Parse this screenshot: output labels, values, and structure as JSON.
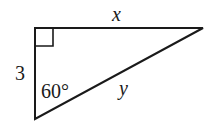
{
  "diagram": {
    "type": "right-triangle",
    "vertices": {
      "right_angle": [
        35,
        28
      ],
      "top_right": [
        203,
        28
      ],
      "bottom": [
        35,
        119
      ]
    },
    "stroke_color": "#1a1a1a",
    "labels": {
      "top_side": "x",
      "left_side": "3",
      "hypotenuse": "y",
      "angle": "60°"
    },
    "right_angle_marker": true
  }
}
